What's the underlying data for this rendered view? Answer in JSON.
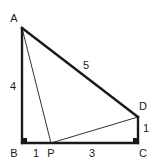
{
  "figure": {
    "background_color": "#ffffff",
    "stroke_color": "#1a1a1a",
    "label_color": "#1a1a1a",
    "width": 157,
    "height": 165
  },
  "vertices": [
    {
      "id": "A",
      "label": "A",
      "x": 22,
      "y": 28,
      "label_x": 14,
      "label_y": 18
    },
    {
      "id": "B",
      "label": "B",
      "x": 22,
      "y": 143,
      "label_x": 14,
      "label_y": 153
    },
    {
      "id": "P",
      "label": "P",
      "x": 51,
      "y": 143,
      "label_x": 51,
      "label_y": 153
    },
    {
      "id": "C",
      "label": "C",
      "x": 138,
      "y": 143,
      "label_x": 143,
      "label_y": 153
    },
    {
      "id": "D",
      "label": "D",
      "x": 138,
      "y": 117,
      "label_x": 143,
      "label_y": 106
    }
  ],
  "edges": [
    {
      "id": "AB",
      "from": "A",
      "to": "B",
      "weight": "thick"
    },
    {
      "id": "AD",
      "from": "A",
      "to": "D",
      "weight": "thick"
    },
    {
      "id": "DC",
      "from": "D",
      "to": "C",
      "weight": "thick"
    },
    {
      "id": "BC",
      "from": "B",
      "to": "C",
      "weight": "thick"
    },
    {
      "id": "AP",
      "from": "A",
      "to": "P",
      "weight": "thin"
    },
    {
      "id": "PD",
      "from": "P",
      "to": "D",
      "weight": "thin"
    }
  ],
  "measures": [
    {
      "id": "AB",
      "text": "4",
      "x": 13,
      "y": 86,
      "segment": "AB"
    },
    {
      "id": "AD",
      "text": "5",
      "x": 86,
      "y": 65,
      "segment": "AD"
    },
    {
      "id": "BP",
      "text": "1",
      "x": 36,
      "y": 153,
      "segment": "BP"
    },
    {
      "id": "PC",
      "text": "3",
      "x": 92,
      "y": 153,
      "segment": "PC"
    },
    {
      "id": "DC",
      "text": "1",
      "x": 146,
      "y": 128,
      "segment": "DC"
    }
  ],
  "right_angles": [
    {
      "id": "B",
      "at": "B",
      "x": 22,
      "y": 143,
      "size": 6
    },
    {
      "id": "C",
      "at": "C",
      "x": 138,
      "y": 143,
      "size": 6
    }
  ]
}
